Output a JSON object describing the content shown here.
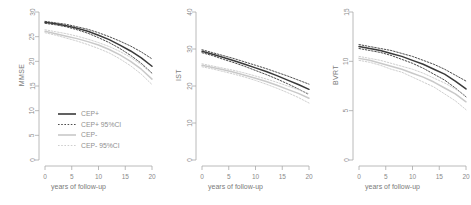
{
  "figure": {
    "panel_count": 3,
    "background": "#ffffff",
    "axis_color": "#a8a8a8",
    "label_color": "#8a8a8a"
  },
  "legend": {
    "position": "bottom-left-panel-1",
    "items": [
      {
        "label": "CEP+",
        "color": "#3a3a3a",
        "style": "solid"
      },
      {
        "label": "CEP+ 95%CI",
        "color": "#3a3a3a",
        "style": "dashed"
      },
      {
        "label": "CEP-",
        "color": "#c8c8c8",
        "style": "solid"
      },
      {
        "label": "CEP- 95%CI",
        "color": "#c8c8c8",
        "style": "dashed"
      }
    ]
  },
  "colors": {
    "cep_plus": "#3a3a3a",
    "cep_minus": "#c9c9c9",
    "axis": "#a8a8a8",
    "text": "#8a8a8a"
  },
  "chart_data": [
    {
      "type": "line",
      "title": "",
      "xlabel": "years of follow-up",
      "ylabel": "MMSE",
      "xlim": [
        0,
        20
      ],
      "ylim": [
        0,
        30
      ],
      "xticks": [
        0,
        5,
        10,
        15,
        20
      ],
      "yticks": [
        0,
        5,
        10,
        15,
        20,
        25,
        30
      ],
      "grid": false,
      "x": [
        0,
        2,
        4,
        6,
        8,
        10,
        12,
        14,
        16,
        18,
        20
      ],
      "series": [
        {
          "name": "CEP+",
          "style": "solid",
          "color": "#3a3a3a",
          "values": [
            27.9,
            27.6,
            27.2,
            26.7,
            26.1,
            25.3,
            24.4,
            23.3,
            22.1,
            20.7,
            19.0
          ]
        },
        {
          "name": "CEP+ 95%CI upper",
          "style": "dashed",
          "color": "#3a3a3a",
          "values": [
            28.1,
            27.8,
            27.5,
            27.0,
            26.5,
            25.8,
            25.0,
            24.1,
            23.1,
            21.9,
            20.5
          ]
        },
        {
          "name": "CEP+ 95%CI lower",
          "style": "dashed",
          "color": "#3a3a3a",
          "values": [
            27.7,
            27.4,
            27.0,
            26.4,
            25.7,
            24.8,
            23.8,
            22.6,
            21.2,
            19.6,
            17.6
          ]
        },
        {
          "name": "CEP-",
          "style": "solid",
          "color": "#c9c9c9",
          "values": [
            26.1,
            25.6,
            25.1,
            24.6,
            24.0,
            23.3,
            22.4,
            21.3,
            20.0,
            18.4,
            16.4
          ]
        },
        {
          "name": "CEP- 95%CI upper",
          "style": "dashed",
          "color": "#c9c9c9",
          "values": [
            26.4,
            26.0,
            25.6,
            25.1,
            24.5,
            23.8,
            23.0,
            22.0,
            20.8,
            19.3,
            17.5
          ]
        },
        {
          "name": "CEP- 95%CI lower",
          "style": "dashed",
          "color": "#c9c9c9",
          "values": [
            25.8,
            25.3,
            24.7,
            24.1,
            23.4,
            22.6,
            21.7,
            20.5,
            19.1,
            17.4,
            15.3
          ]
        }
      ]
    },
    {
      "type": "line",
      "title": "",
      "xlabel": "years of follow-up",
      "ylabel": "IST",
      "xlim": [
        0,
        20
      ],
      "ylim": [
        0,
        40
      ],
      "xticks": [
        0,
        5,
        10,
        15,
        20
      ],
      "yticks": [
        0,
        10,
        20,
        30,
        40
      ],
      "grid": false,
      "x": [
        0,
        2,
        4,
        6,
        8,
        10,
        12,
        14,
        16,
        18,
        20
      ],
      "series": [
        {
          "name": "CEP+",
          "style": "solid",
          "color": "#3a3a3a",
          "values": [
            29.4,
            28.6,
            27.7,
            26.8,
            25.9,
            24.9,
            23.9,
            22.8,
            21.6,
            20.4,
            19.1
          ]
        },
        {
          "name": "CEP+ 95%CI upper",
          "style": "dashed",
          "color": "#3a3a3a",
          "values": [
            29.8,
            29.0,
            28.2,
            27.4,
            26.5,
            25.6,
            24.7,
            23.7,
            22.7,
            21.6,
            20.5
          ]
        },
        {
          "name": "CEP+ 95%CI lower",
          "style": "dashed",
          "color": "#3a3a3a",
          "values": [
            29.0,
            28.2,
            27.2,
            26.3,
            25.3,
            24.2,
            23.1,
            21.9,
            20.6,
            19.2,
            17.7
          ]
        },
        {
          "name": "CEP-",
          "style": "solid",
          "color": "#c9c9c9",
          "values": [
            25.6,
            25.0,
            24.4,
            23.7,
            22.9,
            22.1,
            21.2,
            20.2,
            19.1,
            18.0,
            16.7
          ]
        },
        {
          "name": "CEP- 95%CI upper",
          "style": "dashed",
          "color": "#c9c9c9",
          "values": [
            26.0,
            25.4,
            24.8,
            24.2,
            23.5,
            22.7,
            21.9,
            21.0,
            20.0,
            19.0,
            17.9
          ]
        },
        {
          "name": "CEP- 95%CI lower",
          "style": "dashed",
          "color": "#c9c9c9",
          "values": [
            25.2,
            24.6,
            23.9,
            23.2,
            22.4,
            21.5,
            20.5,
            19.4,
            18.2,
            16.9,
            15.4
          ]
        }
      ]
    },
    {
      "type": "line",
      "title": "",
      "xlabel": "years of follow-up",
      "ylabel": "BVRT",
      "xlim": [
        0,
        20
      ],
      "ylim": [
        0,
        15
      ],
      "xticks": [
        0,
        5,
        10,
        15,
        20
      ],
      "yticks": [
        0,
        5,
        10,
        15
      ],
      "grid": false,
      "x": [
        0,
        2,
        4,
        6,
        8,
        10,
        12,
        14,
        16,
        18,
        20
      ],
      "series": [
        {
          "name": "CEP+",
          "style": "solid",
          "color": "#3a3a3a",
          "values": [
            11.5,
            11.3,
            11.1,
            10.8,
            10.5,
            10.1,
            9.7,
            9.2,
            8.7,
            8.0,
            7.2
          ]
        },
        {
          "name": "CEP+ 95%CI upper",
          "style": "dashed",
          "color": "#3a3a3a",
          "values": [
            11.7,
            11.5,
            11.3,
            11.1,
            10.8,
            10.5,
            10.1,
            9.7,
            9.2,
            8.6,
            8.0
          ]
        },
        {
          "name": "CEP+ 95%CI lower",
          "style": "dashed",
          "color": "#3a3a3a",
          "values": [
            11.3,
            11.1,
            10.9,
            10.6,
            10.2,
            9.8,
            9.3,
            8.7,
            8.1,
            7.3,
            6.4
          ]
        },
        {
          "name": "CEP-",
          "style": "solid",
          "color": "#c9c9c9",
          "values": [
            10.3,
            10.1,
            9.8,
            9.5,
            9.2,
            8.8,
            8.4,
            7.9,
            7.3,
            6.7,
            5.9
          ]
        },
        {
          "name": "CEP- 95%CI upper",
          "style": "dashed",
          "color": "#c9c9c9",
          "values": [
            10.5,
            10.3,
            10.1,
            9.8,
            9.5,
            9.2,
            8.8,
            8.3,
            7.8,
            7.2,
            6.5
          ]
        },
        {
          "name": "CEP- 95%CI lower",
          "style": "dashed",
          "color": "#c9c9c9",
          "values": [
            10.1,
            9.9,
            9.6,
            9.2,
            8.9,
            8.4,
            7.9,
            7.4,
            6.7,
            6.0,
            5.1
          ]
        }
      ]
    }
  ]
}
